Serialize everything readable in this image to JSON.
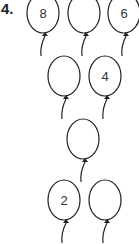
{
  "question_number": "4.",
  "balloons": [
    {
      "id": "b1",
      "row": 1,
      "cx": 43,
      "cy": 13,
      "label": "8"
    },
    {
      "id": "b2",
      "row": 1,
      "cx": 84,
      "cy": 13,
      "label": ""
    },
    {
      "id": "b3",
      "row": 1,
      "cx": 124,
      "cy": 13,
      "label": "6"
    },
    {
      "id": "b4",
      "row": 2,
      "cx": 64,
      "cy": 76,
      "label": ""
    },
    {
      "id": "b5",
      "row": 2,
      "cx": 105,
      "cy": 76,
      "label": "4"
    },
    {
      "id": "b6",
      "row": 3,
      "cx": 83,
      "cy": 139,
      "label": ""
    },
    {
      "id": "b7",
      "row": 4,
      "cx": 64,
      "cy": 200,
      "label": "2"
    },
    {
      "id": "b8",
      "row": 4,
      "cx": 105,
      "cy": 200,
      "label": ""
    }
  ],
  "colors": {
    "ink": "#222222",
    "background": "#ffffff"
  }
}
